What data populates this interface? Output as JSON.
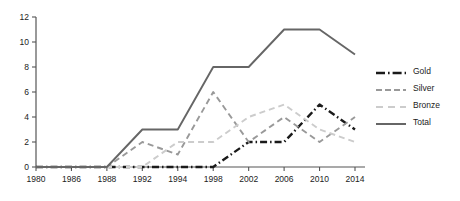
{
  "chart_data": {
    "type": "line",
    "title": "",
    "xlabel": "",
    "ylabel": "",
    "x": [
      1980,
      1986,
      1988,
      1992,
      1994,
      1998,
      2002,
      2006,
      2010,
      2014
    ],
    "xlim": [
      1980,
      2014
    ],
    "ylim": [
      0,
      12
    ],
    "yticks": [
      0,
      2,
      4,
      6,
      8,
      10,
      12
    ],
    "grid": false,
    "legend_position": "right",
    "series": [
      {
        "name": "Gold",
        "color": "#1a1a1a",
        "style": "dash-dot",
        "values": [
          0,
          0,
          0,
          0,
          0,
          0,
          2,
          2,
          5,
          3
        ]
      },
      {
        "name": "Silver",
        "color": "#999999",
        "style": "dashed",
        "values": [
          0,
          0,
          0,
          2,
          1,
          6,
          2,
          4,
          2,
          4
        ]
      },
      {
        "name": "Bronze",
        "color": "#cccccc",
        "style": "dashed",
        "values": [
          0,
          0,
          0,
          0,
          2,
          2,
          4,
          5,
          3,
          2
        ]
      },
      {
        "name": "Total",
        "color": "#666666",
        "style": "solid",
        "values": [
          0,
          0,
          0,
          3,
          3,
          8,
          8,
          11,
          11,
          9
        ]
      }
    ]
  },
  "axes": {
    "y_tick_labels": [
      "0",
      "2",
      "4",
      "6",
      "8",
      "10",
      "12"
    ],
    "x_tick_labels": [
      "1980",
      "1986",
      "1988",
      "1992",
      "1994",
      "1998",
      "2002",
      "2006",
      "2010",
      "2014"
    ]
  },
  "legend": {
    "items": [
      {
        "label": "Gold"
      },
      {
        "label": "Silver"
      },
      {
        "label": "Bronze"
      },
      {
        "label": "Total"
      }
    ]
  }
}
